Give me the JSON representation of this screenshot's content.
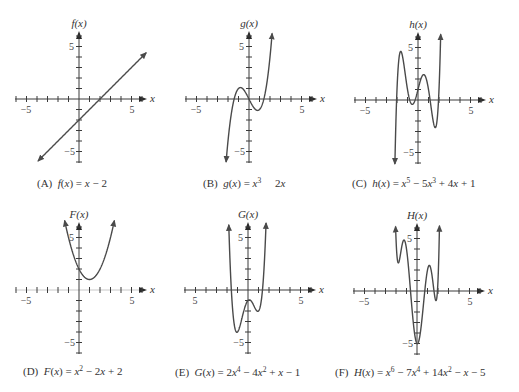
{
  "chart_data": [
    {
      "id": "A",
      "type": "line",
      "title": "(A) f(x) = x − 2",
      "ylabel": "f(x)",
      "xlabel": "x",
      "x_tick_labels": [
        "−5",
        "5"
      ],
      "y_tick_labels": [
        "5",
        "−5"
      ],
      "xlim": [
        -6,
        6
      ],
      "ylim": [
        -6,
        6
      ],
      "grid": false,
      "coefficients_ascending": [
        -2,
        1
      ],
      "domain": [
        -3.9,
        6.4
      ],
      "key_points": [
        {
          "x": 0,
          "y": -2
        },
        {
          "x": 2,
          "y": 0
        }
      ],
      "caption": [
        {
          "text": "(A)  "
        },
        {
          "text": "f",
          "style": "italic"
        },
        {
          "text": "("
        },
        {
          "text": "x",
          "style": "italic"
        },
        {
          "text": ") = "
        },
        {
          "text": "x",
          "style": "italic"
        },
        {
          "text": " − 2"
        }
      ]
    },
    {
      "id": "B",
      "type": "line",
      "title": "(B) g(x) = x³ 2x",
      "ylabel": "g(x)",
      "xlabel": "x",
      "x_tick_labels": [
        "−5",
        "5"
      ],
      "y_tick_labels": [
        "5",
        "−5"
      ],
      "xlim": [
        -6,
        6
      ],
      "ylim": [
        -6,
        6
      ],
      "grid": false,
      "coefficients_ascending": [
        0,
        -2,
        0,
        1
      ],
      "domain": [
        -2.18,
        2.2
      ],
      "key_points": [
        {
          "x": -1.41,
          "y": 0
        },
        {
          "x": -0.82,
          "y": 1.09
        },
        {
          "x": 0,
          "y": 0
        },
        {
          "x": 0.82,
          "y": -1.09
        },
        {
          "x": 1.41,
          "y": 0
        }
      ],
      "caption": [
        {
          "text": "(B)  "
        },
        {
          "text": "g",
          "style": "italic"
        },
        {
          "text": "("
        },
        {
          "text": "x",
          "style": "italic"
        },
        {
          "text": ") = "
        },
        {
          "text": "x",
          "style": "italic"
        },
        {
          "text": "3",
          "style": "sup"
        },
        {
          "text": "     2"
        },
        {
          "text": "x",
          "style": "italic"
        }
      ]
    },
    {
      "id": "C",
      "type": "line",
      "title": "(C) h(x) = x⁵ − 5x³ + 4x + 1",
      "ylabel": "h(x)",
      "xlabel": "x",
      "x_tick_labels": [
        "−5",
        "5"
      ],
      "y_tick_labels": [
        "5",
        "−5"
      ],
      "xlim": [
        -6,
        6
      ],
      "ylim": [
        -6,
        6
      ],
      "grid": false,
      "coefficients_ascending": [
        1,
        4,
        0,
        -5,
        0,
        1
      ],
      "domain": [
        -2.2,
        2.16
      ],
      "key_points": [
        {
          "x": -1.64,
          "y": 4.63
        },
        {
          "x": -0.54,
          "y": -0.42
        },
        {
          "x": 0.54,
          "y": 2.42
        },
        {
          "x": 1.64,
          "y": -2.63
        }
      ],
      "caption": [
        {
          "text": "(C)  "
        },
        {
          "text": "h",
          "style": "italic"
        },
        {
          "text": "("
        },
        {
          "text": "x",
          "style": "italic"
        },
        {
          "text": ") = "
        },
        {
          "text": "x",
          "style": "italic"
        },
        {
          "text": "5",
          "style": "sup"
        },
        {
          "text": " − 5"
        },
        {
          "text": "x",
          "style": "italic"
        },
        {
          "text": "3",
          "style": "sup"
        },
        {
          "text": " + 4"
        },
        {
          "text": "x",
          "style": "italic"
        },
        {
          "text": " + 1"
        }
      ]
    },
    {
      "id": "D",
      "type": "line",
      "title": "(D) F(x) = x² − 2x + 2",
      "ylabel": "F(x)",
      "xlabel": "x",
      "x_tick_labels": [
        "−5",
        "5"
      ],
      "y_tick_labels": [
        "5",
        "−5"
      ],
      "xlim": [
        -6,
        6
      ],
      "ylim": [
        -6,
        6
      ],
      "grid": false,
      "coefficients_ascending": [
        2,
        -2,
        1
      ],
      "domain": [
        -1.37,
        3.37
      ],
      "key_points": [
        {
          "x": 0,
          "y": 2
        },
        {
          "x": 1,
          "y": 1
        }
      ],
      "caption": [
        {
          "text": "(D)  "
        },
        {
          "text": "F",
          "style": "italic"
        },
        {
          "text": "("
        },
        {
          "text": "x",
          "style": "italic"
        },
        {
          "text": ") = "
        },
        {
          "text": "x",
          "style": "italic"
        },
        {
          "text": "2",
          "style": "sup"
        },
        {
          "text": " − 2"
        },
        {
          "text": "x",
          "style": "italic"
        },
        {
          "text": " + 2"
        }
      ]
    },
    {
      "id": "E",
      "type": "line",
      "title": "(E) G(x) = 2x⁴ − 4x² + x − 1",
      "ylabel": "G(x)",
      "xlabel": "x",
      "x_tick_labels": [
        "5",
        "5"
      ],
      "y_tick_labels": [
        "5",
        "−5"
      ],
      "xlim": [
        -6,
        6
      ],
      "ylim": [
        -6,
        6
      ],
      "grid": false,
      "coefficients_ascending": [
        -1,
        1,
        -4,
        0,
        2
      ],
      "domain": [
        -1.83,
        1.72
      ],
      "key_points": [
        {
          "x": -1.06,
          "y": -4.03
        },
        {
          "x": 0.13,
          "y": -0.94
        },
        {
          "x": 0.93,
          "y": -2.03
        }
      ],
      "caption": [
        {
          "text": "(E)  "
        },
        {
          "text": "G",
          "style": "italic"
        },
        {
          "text": "("
        },
        {
          "text": "x",
          "style": "italic"
        },
        {
          "text": ") = 2"
        },
        {
          "text": "x",
          "style": "italic"
        },
        {
          "text": "4",
          "style": "sup"
        },
        {
          "text": " − 4"
        },
        {
          "text": "x",
          "style": "italic"
        },
        {
          "text": "2",
          "style": "sup"
        },
        {
          "text": " + "
        },
        {
          "text": "x",
          "style": "italic"
        },
        {
          "text": " − 1"
        }
      ]
    },
    {
      "id": "F",
      "type": "line",
      "title": "(F) H(x) = x⁶ − 7x⁴ + 14x² − x − 5",
      "ylabel": "H(x)",
      "xlabel": "x",
      "x_tick_labels": [
        "−5",
        "5"
      ],
      "y_tick_labels": [
        "5",
        "−5"
      ],
      "xlim": [
        -6,
        6
      ],
      "ylim": [
        -6,
        6
      ],
      "grid": false,
      "coefficients_ascending": [
        -5,
        -1,
        14,
        0,
        -7,
        0,
        1
      ],
      "domain": [
        -2.04,
        2.14
      ],
      "key_points": [
        {
          "x": -1.9,
          "y": 3.27
        },
        {
          "x": -1.2,
          "y": 4.83
        },
        {
          "x": 0.04,
          "y": -5.02
        },
        {
          "x": 1.2,
          "y": 2.43
        },
        {
          "x": 1.9,
          "y": -0.53
        }
      ],
      "caption": [
        {
          "text": "(F)  "
        },
        {
          "text": "H",
          "style": "italic"
        },
        {
          "text": "("
        },
        {
          "text": "x",
          "style": "italic"
        },
        {
          "text": ") = "
        },
        {
          "text": "x",
          "style": "italic"
        },
        {
          "text": "6",
          "style": "sup"
        },
        {
          "text": " − 7"
        },
        {
          "text": "x",
          "style": "italic"
        },
        {
          "text": "4",
          "style": "sup"
        },
        {
          "text": " + 14"
        },
        {
          "text": "x",
          "style": "italic"
        },
        {
          "text": "2",
          "style": "sup"
        },
        {
          "text": " − "
        },
        {
          "text": "x",
          "style": "italic"
        },
        {
          "text": " − 5"
        }
      ]
    }
  ]
}
